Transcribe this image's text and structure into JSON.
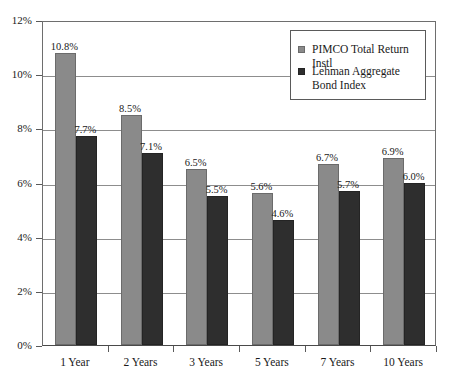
{
  "chart_data": {
    "type": "bar",
    "title": "",
    "subtitle": "",
    "xlabel": "",
    "ylabel": "",
    "categories": [
      "1 Year",
      "2 Years",
      "3 Years",
      "5 Years",
      "7 Years",
      "10 Years"
    ],
    "series": [
      {
        "name": "PIMCO Total Return Instl",
        "color": "#8a8a8a",
        "values": [
          10.8,
          8.5,
          6.5,
          5.6,
          6.7,
          6.9
        ],
        "labels": [
          "10.8%",
          "8.5%",
          "6.5%",
          "5.6%",
          "6.7%",
          "6.9%"
        ]
      },
      {
        "name": "Lehman Aggregate Bond Index",
        "color": "#2e2e2e",
        "values": [
          7.7,
          7.1,
          5.5,
          4.6,
          5.7,
          6.0
        ],
        "labels": [
          "7.7%",
          "7.1%",
          "5.5%",
          "4.6%",
          "5.7%",
          "6.0%"
        ]
      }
    ],
    "ylim": [
      0,
      12
    ],
    "ytick_values": [
      0,
      2,
      4,
      6,
      8,
      10,
      12
    ],
    "ytick_labels": [
      "0%",
      "2%",
      "4%",
      "6%",
      "8%",
      "10%",
      "12%"
    ],
    "grid": true,
    "grid_axis": "y",
    "legend_position": "top-right",
    "value_labels_shown": true
  },
  "legend": {
    "entries": [
      {
        "label": "PIMCO Total Return Instl",
        "marker": "square-gray"
      },
      {
        "label": "Lehman Aggregate Bond Index",
        "marker": "square-dark"
      }
    ]
  }
}
